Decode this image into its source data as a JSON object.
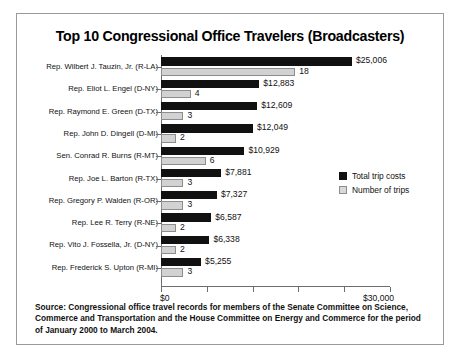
{
  "chart_data": {
    "type": "bar",
    "title": "Top 10 Congressional Office Travelers (Broadcasters)",
    "orientation": "horizontal",
    "grouped": true,
    "xlabel": "",
    "ylabel": "",
    "xlim": [
      0,
      30000
    ],
    "grid": false,
    "legend_position": "right-middle",
    "categories": [
      "Rep. Wilbert J. Tauzin, Jr. (R-LA)",
      "Rep. Eliot L. Engel (D-NY)",
      "Rep. Raymond E. Green (D-TX)",
      "Rep. John D. Dingell (D-MI)",
      "Sen. Conrad R. Burns (R-MT)",
      "Rep. Joe L. Barton (R-TX)",
      "Rep. Gregory P. Walden (R-OR)",
      "Rep. Lee R. Terry (R-NE)",
      "Rep. Vito J. Fossella, Jr. (D-NY)",
      "Rep. Frederick S. Upton (R-MI)"
    ],
    "series": [
      {
        "name": "Total trip costs",
        "color": "#111111",
        "values": [
          25006,
          12883,
          12609,
          12049,
          10929,
          7881,
          7327,
          6587,
          6338,
          5255
        ],
        "labels": [
          "$25,006",
          "$12,883",
          "$12,609",
          "$12,049",
          "$10,929",
          "$7,881",
          "$7,327",
          "$6,587",
          "$6,338",
          "$5,255"
        ]
      },
      {
        "name": "Number of trips",
        "color": "#d2d2d2",
        "values": [
          18,
          4,
          3,
          2,
          6,
          3,
          3,
          2,
          2,
          3
        ],
        "labels": [
          "18",
          "4",
          "3",
          "2",
          "6",
          "3",
          "3",
          "2",
          "2",
          "3"
        ]
      }
    ],
    "xticks": [
      0,
      6000,
      12000,
      18000,
      24000,
      30000
    ],
    "xtick_labels": [
      "$0",
      "",
      "",
      "",
      "",
      "$30,000"
    ],
    "source": "Source: Congressional office travel records for members of the Senate Committee on Science, Commerce and Transportation and the House Committee on Energy and Commerce for the period of January 2000 to March 2004."
  }
}
